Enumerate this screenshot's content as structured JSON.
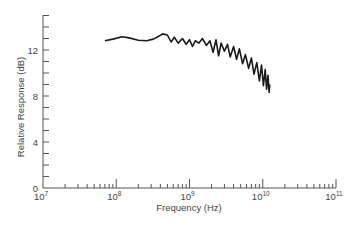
{
  "chart_data": {
    "type": "line",
    "title": "",
    "xlabel": "Frequency (Hz)",
    "ylabel": "Relative Response (dB)",
    "xscale": "log",
    "xlim": [
      10000000.0,
      100000000000.0
    ],
    "ylim": [
      0,
      15
    ],
    "x_ticks": [
      {
        "base": "10",
        "exp": "7",
        "value": 10000000.0
      },
      {
        "base": "10",
        "exp": "8",
        "value": 100000000.0
      },
      {
        "base": "10",
        "exp": "9",
        "value": 1000000000.0
      },
      {
        "base": "10",
        "exp": "10",
        "value": 10000000000.0
      },
      {
        "base": "10",
        "exp": "11",
        "value": 100000000000.0
      }
    ],
    "y_ticks": [
      "0",
      "4",
      "8",
      "12"
    ],
    "y_tick_values": [
      0,
      4,
      8,
      12
    ],
    "y_minor_step": 1,
    "grid": false,
    "legend": null,
    "series": [
      {
        "name": "response",
        "color": "#1a1a1a",
        "x": [
          70000000.0,
          90000000.0,
          120000000.0,
          150000000.0,
          200000000.0,
          260000000.0,
          320000000.0,
          380000000.0,
          430000000.0,
          500000000.0,
          560000000.0,
          620000000.0,
          700000000.0,
          800000000.0,
          900000000.0,
          1000000000.0,
          1100000000.0,
          1200000000.0,
          1350000000.0,
          1500000000.0,
          1700000000.0,
          1900000000.0,
          2100000000.0,
          2300000000.0,
          2500000000.0,
          2700000000.0,
          3000000000.0,
          3300000000.0,
          3600000000.0,
          4000000000.0,
          4400000000.0,
          4800000000.0,
          5300000000.0,
          5800000000.0,
          6400000000.0,
          7000000000.0,
          7600000000.0,
          8300000000.0,
          9000000000.0,
          9600000000.0,
          10200000000.0,
          10800000000.0,
          11300000000.0,
          11800000000.0,
          12200000000.0,
          12500000000.0
        ],
        "values": [
          12.8,
          12.95,
          13.15,
          13.05,
          12.85,
          12.8,
          12.95,
          13.2,
          13.4,
          13.3,
          12.7,
          13.1,
          12.6,
          13.0,
          12.5,
          12.9,
          12.3,
          12.8,
          12.6,
          13.0,
          12.4,
          12.8,
          11.8,
          12.9,
          11.5,
          12.6,
          11.9,
          12.5,
          11.4,
          12.3,
          11.2,
          12.1,
          10.8,
          11.6,
          10.4,
          11.3,
          9.9,
          10.9,
          9.3,
          10.7,
          8.9,
          10.3,
          8.6,
          9.8,
          8.3,
          9.0
        ]
      }
    ]
  }
}
